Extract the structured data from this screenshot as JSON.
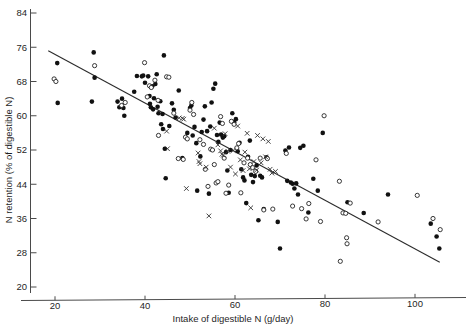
{
  "chart_data": {
    "type": "scatter",
    "title": "",
    "xlabel": "Intake of digestible N (g/day)",
    "ylabel": "N retention (% of digestible N)",
    "xlim": [
      16,
      110
    ],
    "ylim": [
      18,
      86
    ],
    "xticks": [
      20,
      40,
      60,
      80,
      100
    ],
    "yticks": [
      20,
      28,
      36,
      44,
      52,
      60,
      68,
      76,
      84
    ],
    "grid": false,
    "legend_position": "none",
    "regression_line": {
      "label": "fitted regression line",
      "x_start": 18.5,
      "y_start": 75.2,
      "x_end": 105.5,
      "y_end": 25.8
    },
    "series": [
      {
        "name": "filled-circle",
        "marker": "filled circle",
        "color": "#111111",
        "points": [
          [
            20.5,
            72.3
          ],
          [
            20.6,
            63.0
          ],
          [
            28.6,
            74.8
          ],
          [
            28.8,
            68.9
          ],
          [
            28.2,
            63.3
          ],
          [
            33.9,
            63.3
          ],
          [
            34.3,
            62.0
          ],
          [
            34.9,
            64.0
          ],
          [
            35.2,
            61.8
          ],
          [
            35.4,
            60.0
          ],
          [
            37.6,
            65.6
          ],
          [
            38.2,
            69.3
          ],
          [
            39.3,
            69.2
          ],
          [
            39.6,
            69.4
          ],
          [
            40.0,
            67.7
          ],
          [
            40.7,
            69.2
          ],
          [
            41.0,
            64.6
          ],
          [
            41.1,
            62.8
          ],
          [
            41.3,
            62.0
          ],
          [
            41.6,
            66.9
          ],
          [
            41.8,
            61.5
          ],
          [
            42.0,
            64.1
          ],
          [
            42.3,
            67.4
          ],
          [
            42.6,
            69.7
          ],
          [
            42.8,
            62.1
          ],
          [
            43.0,
            60.6
          ],
          [
            43.4,
            63.4
          ],
          [
            43.6,
            58.0
          ],
          [
            43.9,
            60.4
          ],
          [
            44.0,
            56.9
          ],
          [
            44.2,
            74.1
          ],
          [
            44.4,
            52.3
          ],
          [
            44.6,
            45.4
          ],
          [
            45.4,
            57.6
          ],
          [
            46.0,
            62.9
          ],
          [
            46.4,
            61.4
          ],
          [
            46.8,
            59.6
          ],
          [
            47.5,
            65.9
          ],
          [
            48.3,
            50.1
          ],
          [
            49.4,
            56.0
          ],
          [
            50.0,
            61.8
          ],
          [
            50.3,
            62.4
          ],
          [
            50.6,
            55.4
          ],
          [
            51.0,
            57.4
          ],
          [
            51.4,
            53.6
          ],
          [
            51.6,
            42.5
          ],
          [
            52.3,
            50.5
          ],
          [
            52.6,
            56.2
          ],
          [
            53.0,
            59.1
          ],
          [
            53.3,
            62.2
          ],
          [
            53.8,
            56.4
          ],
          [
            54.2,
            41.8
          ],
          [
            54.5,
            57.5
          ],
          [
            54.8,
            63.1
          ],
          [
            55.2,
            66.3
          ],
          [
            55.6,
            67.5
          ],
          [
            56.0,
            55.5
          ],
          [
            56.3,
            53.9
          ],
          [
            56.6,
            58.4
          ],
          [
            56.9,
            55.6
          ],
          [
            57.3,
            54.9
          ],
          [
            57.6,
            55.2
          ],
          [
            58.0,
            51.5
          ],
          [
            58.3,
            47.2
          ],
          [
            58.6,
            42.0
          ],
          [
            59.0,
            52.0
          ],
          [
            59.4,
            60.6
          ],
          [
            59.8,
            58.5
          ],
          [
            60.2,
            59.2
          ],
          [
            60.6,
            51.7
          ],
          [
            61.0,
            53.7
          ],
          [
            61.4,
            47.5
          ],
          [
            61.8,
            45.6
          ],
          [
            62.1,
            44.9
          ],
          [
            62.5,
            39.6
          ],
          [
            62.9,
            50.4
          ],
          [
            63.3,
            54.2
          ],
          [
            63.6,
            46.2
          ],
          [
            64.0,
            44.5
          ],
          [
            64.4,
            45.9
          ],
          [
            64.8,
            48.4
          ],
          [
            65.2,
            35.6
          ],
          [
            65.6,
            46.0
          ],
          [
            66.0,
            45.6
          ],
          [
            66.4,
            38.2
          ],
          [
            67.0,
            50.3
          ],
          [
            69.5,
            35.2
          ],
          [
            70.0,
            29.0
          ],
          [
            71.2,
            51.9
          ],
          [
            71.6,
            44.8
          ],
          [
            72.0,
            52.6
          ],
          [
            72.4,
            44.4
          ],
          [
            72.8,
            44.1
          ],
          [
            73.2,
            43.0
          ],
          [
            73.6,
            44.2
          ],
          [
            74.0,
            41.6
          ],
          [
            74.5,
            52.5
          ],
          [
            75.2,
            53.0
          ],
          [
            76.3,
            37.4
          ],
          [
            77.4,
            45.3
          ],
          [
            78.4,
            42.5
          ],
          [
            79.5,
            56.0
          ],
          [
            85.0,
            39.8
          ],
          [
            88.6,
            37.3
          ],
          [
            94.0,
            41.6
          ],
          [
            103.5,
            34.8
          ],
          [
            104.8,
            31.8
          ],
          [
            105.4,
            29.0
          ]
        ]
      },
      {
        "name": "open-circle",
        "marker": "open circle",
        "color": "#ffffff",
        "points": [
          [
            19.8,
            68.6
          ],
          [
            20.2,
            68.0
          ],
          [
            28.8,
            71.7
          ],
          [
            34.8,
            62.4
          ],
          [
            35.6,
            63.1
          ],
          [
            39.9,
            72.4
          ],
          [
            40.5,
            64.4
          ],
          [
            41.0,
            67.0
          ],
          [
            41.4,
            66.6
          ],
          [
            42.2,
            68.3
          ],
          [
            42.9,
            63.6
          ],
          [
            43.0,
            55.4
          ],
          [
            44.8,
            69.1
          ],
          [
            45.3,
            69.0
          ],
          [
            46.4,
            60.6
          ],
          [
            47.4,
            50.0
          ],
          [
            48.5,
            49.8
          ],
          [
            49.0,
            55.0
          ],
          [
            49.4,
            54.6
          ],
          [
            50.0,
            61.3
          ],
          [
            50.4,
            63.1
          ],
          [
            50.8,
            60.3
          ],
          [
            52.2,
            54.4
          ],
          [
            53.0,
            53.3
          ],
          [
            53.4,
            47.5
          ],
          [
            54.0,
            43.5
          ],
          [
            54.6,
            52.2
          ],
          [
            55.0,
            52.0
          ],
          [
            55.4,
            48.6
          ],
          [
            55.8,
            44.3
          ],
          [
            56.2,
            44.6
          ],
          [
            56.8,
            59.8
          ],
          [
            57.2,
            58.2
          ],
          [
            57.6,
            50.1
          ],
          [
            58.0,
            41.9
          ],
          [
            58.6,
            43.8
          ],
          [
            59.2,
            58.7
          ],
          [
            59.8,
            58.0
          ],
          [
            60.4,
            52.5
          ],
          [
            60.8,
            53.5
          ],
          [
            61.3,
            42.0
          ],
          [
            62.0,
            49.0
          ],
          [
            62.8,
            50.1
          ],
          [
            63.4,
            48.6
          ],
          [
            63.9,
            47.9
          ],
          [
            64.6,
            47.0
          ],
          [
            65.6,
            50.1
          ],
          [
            66.4,
            38.0
          ],
          [
            67.2,
            50.0
          ],
          [
            68.4,
            38.2
          ],
          [
            71.4,
            51.2
          ],
          [
            72.8,
            38.9
          ],
          [
            74.8,
            38.3
          ],
          [
            75.8,
            35.9
          ],
          [
            76.4,
            39.5
          ],
          [
            78.0,
            49.7
          ],
          [
            79.0,
            35.3
          ],
          [
            79.8,
            60.0
          ],
          [
            83.2,
            44.7
          ],
          [
            83.4,
            26.0
          ],
          [
            84.0,
            37.3
          ],
          [
            84.6,
            37.2
          ],
          [
            84.8,
            31.5
          ],
          [
            84.9,
            30.1
          ],
          [
            85.6,
            39.6
          ],
          [
            91.8,
            35.2
          ],
          [
            100.5,
            41.4
          ],
          [
            104.0,
            36.0
          ],
          [
            105.6,
            33.4
          ]
        ]
      },
      {
        "name": "cross",
        "marker": "x",
        "color": "#333333",
        "points": [
          [
            44.8,
            56.4
          ],
          [
            45.0,
            52.3
          ],
          [
            47.6,
            59.5
          ],
          [
            48.3,
            59.4
          ],
          [
            48.6,
            59.2
          ],
          [
            49.2,
            43.0
          ],
          [
            51.8,
            51.3
          ],
          [
            52.0,
            49.3
          ],
          [
            52.2,
            48.8
          ],
          [
            53.6,
            48.0
          ],
          [
            54.2,
            36.6
          ],
          [
            55.4,
            57.1
          ],
          [
            56.2,
            53.2
          ],
          [
            56.8,
            51.8
          ],
          [
            57.1,
            51.0
          ],
          [
            57.4,
            50.8
          ],
          [
            57.8,
            55.8
          ],
          [
            58.4,
            51.7
          ],
          [
            59.0,
            48.0
          ],
          [
            59.6,
            51.9
          ],
          [
            60.1,
            46.4
          ],
          [
            60.6,
            57.6
          ],
          [
            61.2,
            49.7
          ],
          [
            61.8,
            47.2
          ],
          [
            62.2,
            51.5
          ],
          [
            62.7,
            55.9
          ],
          [
            63.2,
            47.6
          ],
          [
            63.5,
            38.5
          ],
          [
            64.2,
            49.3
          ],
          [
            64.8,
            47.3
          ],
          [
            65.0,
            55.4
          ],
          [
            65.8,
            49.0
          ],
          [
            66.2,
            54.6
          ],
          [
            66.8,
            50.4
          ],
          [
            67.4,
            54.0
          ],
          [
            67.8,
            47.5
          ],
          [
            68.2,
            46.6
          ],
          [
            69.0,
            47.0
          ]
        ]
      }
    ]
  }
}
